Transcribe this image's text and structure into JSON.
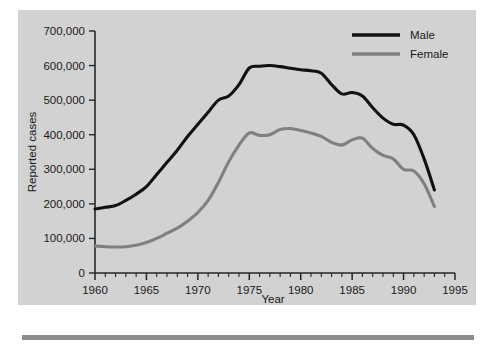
{
  "chart_data": {
    "type": "line",
    "title": "",
    "subtitle": "",
    "xlabel": "Year",
    "ylabel": "Reported cases",
    "xlim": [
      1960,
      1995
    ],
    "ylim": [
      0,
      700000
    ],
    "grid": false,
    "legend_position": "top-right",
    "x_ticks": [
      1960,
      1965,
      1970,
      1975,
      1980,
      1985,
      1990,
      1995
    ],
    "x_tick_labels": [
      "1960",
      "1965",
      "1970",
      "1975",
      "1980",
      "1985",
      "1990",
      "1995"
    ],
    "x_minor_tick_step": 1,
    "y_ticks": [
      0,
      100000,
      200000,
      300000,
      400000,
      500000,
      600000,
      700000
    ],
    "y_tick_labels": [
      "0",
      "100,000",
      "200,000",
      "300,000",
      "400,000",
      "500,000",
      "600,000",
      "700,000"
    ],
    "x": [
      1960,
      1961,
      1962,
      1963,
      1964,
      1965,
      1966,
      1967,
      1968,
      1969,
      1970,
      1971,
      1972,
      1973,
      1974,
      1975,
      1976,
      1977,
      1978,
      1979,
      1980,
      1981,
      1982,
      1983,
      1984,
      1985,
      1986,
      1987,
      1988,
      1989,
      1990,
      1991,
      1992,
      1993
    ],
    "series": [
      {
        "name": "Male",
        "color": "#111111",
        "values": [
          185000,
          190000,
          195000,
          210000,
          228000,
          250000,
          285000,
          320000,
          355000,
          395000,
          430000,
          465000,
          500000,
          512000,
          545000,
          593000,
          598000,
          600000,
          597000,
          592000,
          588000,
          585000,
          578000,
          545000,
          518000,
          522000,
          512000,
          478000,
          448000,
          430000,
          428000,
          400000,
          330000,
          240000
        ]
      },
      {
        "name": "Female",
        "color": "#808080",
        "values": [
          78000,
          76000,
          75000,
          76000,
          80000,
          88000,
          100000,
          115000,
          130000,
          150000,
          175000,
          210000,
          262000,
          322000,
          370000,
          405000,
          398000,
          400000,
          415000,
          418000,
          412000,
          405000,
          395000,
          378000,
          370000,
          385000,
          390000,
          360000,
          340000,
          330000,
          300000,
          295000,
          258000,
          192000
        ]
      }
    ]
  },
  "legend": {
    "items": [
      {
        "label": "Male",
        "color": "#111111"
      },
      {
        "label": "Female",
        "color": "#808080"
      }
    ]
  },
  "colors": {
    "panel_background": "#d2d2d2",
    "axis": "#262626",
    "male_line": "#111111",
    "female_line": "#808080",
    "rule": "#8c8c8c"
  }
}
